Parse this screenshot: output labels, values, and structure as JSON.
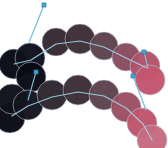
{
  "canvas": {
    "width": 168,
    "height": 148,
    "background": "#ffffff"
  },
  "palette": {
    "dark": "#0a0a14",
    "dark_navy": "#10101c",
    "mid_dark": "#342a30",
    "mid": "#4a3740",
    "mid_warm": "#5d434e",
    "transition": "#6b4652",
    "rose_dark": "#8a4c5e",
    "rose": "#a85066",
    "pink": "#c4566e",
    "pink_light": "#cc6077",
    "line": "#9fd4e8",
    "line_stroke": "#86c6de",
    "marker_fill": "#3fa9d4",
    "marker_edge": "#1f7fae",
    "blob_stroke": "#b9c6d6"
  },
  "chart_data": {
    "type": "scatter",
    "title": "",
    "xlabel": "",
    "ylabel": "",
    "xlim": [
      0,
      168
    ],
    "ylim": [
      0,
      148
    ],
    "grid": false,
    "legend": "none",
    "series": [
      {
        "name": "upper-chain",
        "radius": 14,
        "points": [
          {
            "x": 14,
            "y": 64,
            "r": 15,
            "color": "#0a0a14"
          },
          {
            "x": 30,
            "y": 58,
            "r": 15,
            "color": "#10101c"
          },
          {
            "x": 31,
            "y": 77,
            "r": 15,
            "color": "#0a0a14"
          },
          {
            "x": 56,
            "y": 42,
            "r": 14,
            "color": "#342a30"
          },
          {
            "x": 80,
            "y": 39,
            "r": 15,
            "color": "#3c2e34"
          },
          {
            "x": 104,
            "y": 46,
            "r": 14,
            "color": "#5d434e"
          },
          {
            "x": 126,
            "y": 57,
            "r": 14,
            "color": "#8a4c5e"
          },
          {
            "x": 145,
            "y": 66,
            "r": 15,
            "color": "#b1536a"
          },
          {
            "x": 150,
            "y": 80,
            "r": 15,
            "color": "#c4566e"
          }
        ]
      },
      {
        "name": "lower-chain",
        "radius": 14,
        "points": [
          {
            "x": 10,
            "y": 118,
            "r": 15,
            "color": "#0a0a14"
          },
          {
            "x": 12,
            "y": 99,
            "r": 15,
            "color": "#10101c"
          },
          {
            "x": 28,
            "y": 105,
            "r": 15,
            "color": "#14141f"
          },
          {
            "x": 52,
            "y": 95,
            "r": 15,
            "color": "#2e2730"
          },
          {
            "x": 78,
            "y": 90,
            "r": 15,
            "color": "#3c2e36"
          },
          {
            "x": 104,
            "y": 95,
            "r": 15,
            "color": "#5d434e"
          },
          {
            "x": 126,
            "y": 107,
            "r": 15,
            "color": "#9d4f63"
          },
          {
            "x": 142,
            "y": 123,
            "r": 15,
            "color": "#c0556c"
          },
          {
            "x": 152,
            "y": 140,
            "r": 15,
            "color": "#c86b80"
          }
        ]
      }
    ],
    "connector_paths": [
      {
        "name": "upper-spine",
        "points": [
          [
            14,
            64
          ],
          [
            31,
            60
          ],
          [
            56,
            44
          ],
          [
            80,
            41
          ],
          [
            104,
            47
          ],
          [
            126,
            58
          ],
          [
            147,
            68
          ]
        ]
      },
      {
        "name": "lower-spine",
        "points": [
          [
            12,
            116
          ],
          [
            28,
            106
          ],
          [
            52,
            97
          ],
          [
            78,
            92
          ],
          [
            104,
            96
          ],
          [
            126,
            108
          ],
          [
            143,
            124
          ],
          [
            152,
            140
          ]
        ]
      },
      {
        "name": "upper-left-leader",
        "points": [
          [
            44,
            5
          ],
          [
            30,
            40
          ],
          [
            18,
            70
          ]
        ]
      },
      {
        "name": "lower-left-leader",
        "points": [
          [
            36,
            72
          ],
          [
            28,
            100
          ],
          [
            14,
            122
          ]
        ]
      },
      {
        "name": "upper-right-leader",
        "points": [
          [
            144,
            52
          ],
          [
            148,
            68
          ],
          [
            150,
            84
          ]
        ]
      },
      {
        "name": "lower-right-leader",
        "points": [
          [
            133,
            76
          ],
          [
            146,
            110
          ],
          [
            152,
            136
          ]
        ]
      }
    ],
    "markers": [
      {
        "name": "marker-top-left",
        "x": 44,
        "y": 5,
        "size": 4
      },
      {
        "name": "marker-mid-left",
        "x": 36,
        "y": 72,
        "size": 4
      },
      {
        "name": "marker-top-right",
        "x": 144,
        "y": 52,
        "size": 4
      },
      {
        "name": "marker-mid-right",
        "x": 133,
        "y": 76,
        "size": 4
      }
    ]
  }
}
